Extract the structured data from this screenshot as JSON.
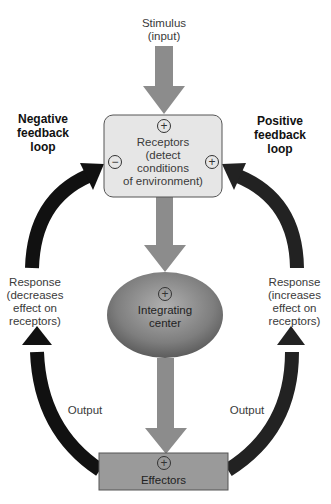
{
  "stimulus": {
    "label": "Stimulus (input)",
    "line1": "Stimulus",
    "line2": "(input)"
  },
  "receptors": {
    "sign_top": "+",
    "sign_left": "−",
    "sign_right": "+",
    "line1": "Receptors",
    "line2": "(detect",
    "line3": "conditions",
    "line4": "of environment)"
  },
  "integrating_center": {
    "sign": "+",
    "line1": "Integrating",
    "line2": "center"
  },
  "effectors": {
    "sign": "+",
    "label": "Effectors"
  },
  "negative_loop": {
    "line1": "Negative",
    "line2": "feedback",
    "line3": "loop",
    "response": {
      "line1": "Response",
      "line2": "(decreases",
      "line3": "effect on",
      "line4": "receptors)"
    },
    "output": "Output"
  },
  "positive_loop": {
    "line1": "Positive",
    "line2": "feedback",
    "line3": "loop",
    "response": {
      "line1": "Response",
      "line2": "(increases",
      "line3": "effect on",
      "line4": "receptors)"
    },
    "output": "Output"
  },
  "colors": {
    "flow_arrow": "#8c8c8c",
    "loop_arrow": "#111111",
    "receptor_box": "#e6e6e6",
    "effector_box": "#9a9a9a",
    "integrating_center": "#7a7a7a"
  }
}
